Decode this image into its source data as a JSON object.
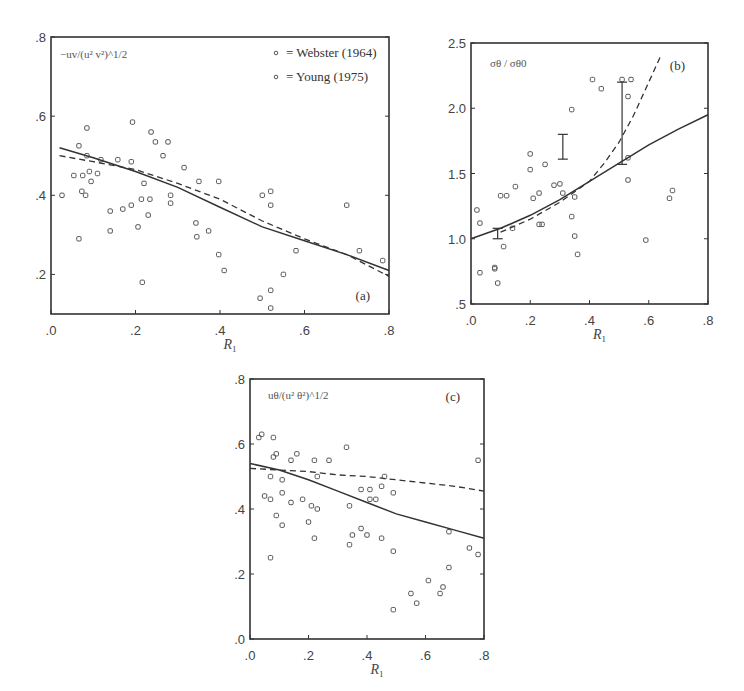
{
  "chart_data": [
    {
      "panel": "a",
      "type": "scatter",
      "tag": "(a)",
      "ylabel": "−uv/(u² v²)^1/2",
      "xlabel": "R1",
      "xlim": [
        0.0,
        0.8
      ],
      "ylim": [
        0.1,
        0.8
      ],
      "xticks": [
        ".0",
        ".2",
        ".4",
        ".6",
        ".8"
      ],
      "yticks": [
        ".2",
        ".4",
        ".6",
        ".8"
      ],
      "grid": false,
      "legend": {
        "position": "upper-right",
        "entries": [
          "= Webster (1964)",
          "= Young (1975)"
        ]
      },
      "series": [
        {
          "name": "data",
          "marker": "o",
          "points": [
            [
              0.026,
              0.4
            ],
            [
              0.066,
              0.29
            ],
            [
              0.054,
              0.45
            ],
            [
              0.066,
              0.525
            ],
            [
              0.085,
              0.57
            ],
            [
              0.073,
              0.41
            ],
            [
              0.082,
              0.4
            ],
            [
              0.075,
              0.45
            ],
            [
              0.091,
              0.46
            ],
            [
              0.095,
              0.435
            ],
            [
              0.11,
              0.455
            ],
            [
              0.085,
              0.5
            ],
            [
              0.118,
              0.49
            ],
            [
              0.14,
              0.36
            ],
            [
              0.14,
              0.31
            ],
            [
              0.158,
              0.49
            ],
            [
              0.17,
              0.365
            ],
            [
              0.19,
              0.375
            ],
            [
              0.19,
              0.485
            ],
            [
              0.193,
              0.585
            ],
            [
              0.206,
              0.32
            ],
            [
              0.214,
              0.39
            ],
            [
              0.216,
              0.18
            ],
            [
              0.22,
              0.43
            ],
            [
              0.23,
              0.35
            ],
            [
              0.234,
              0.39
            ],
            [
              0.237,
              0.56
            ],
            [
              0.247,
              0.535
            ],
            [
              0.265,
              0.5
            ],
            [
              0.277,
              0.535
            ],
            [
              0.283,
              0.4
            ],
            [
              0.283,
              0.38
            ],
            [
              0.315,
              0.47
            ],
            [
              0.343,
              0.33
            ],
            [
              0.345,
              0.295
            ],
            [
              0.35,
              0.435
            ],
            [
              0.373,
              0.31
            ],
            [
              0.397,
              0.435
            ],
            [
              0.397,
              0.25
            ],
            [
              0.41,
              0.21
            ],
            [
              0.5,
              0.4
            ],
            [
              0.52,
              0.41
            ],
            [
              0.52,
              0.375
            ],
            [
              0.495,
              0.14
            ],
            [
              0.52,
              0.16
            ],
            [
              0.52,
              0.115
            ],
            [
              0.55,
              0.2
            ],
            [
              0.58,
              0.26
            ],
            [
              0.7,
              0.375
            ],
            [
              0.73,
              0.26
            ],
            [
              0.785,
              0.235
            ]
          ]
        },
        {
          "name": "solid curve",
          "type": "line",
          "style": "solid",
          "points": [
            [
              0.02,
              0.52
            ],
            [
              0.1,
              0.495
            ],
            [
              0.2,
              0.46
            ],
            [
              0.3,
              0.42
            ],
            [
              0.4,
              0.37
            ],
            [
              0.5,
              0.32
            ],
            [
              0.6,
              0.285
            ],
            [
              0.7,
              0.25
            ],
            [
              0.8,
              0.21
            ]
          ]
        },
        {
          "name": "dashed curve",
          "type": "line",
          "style": "dashed",
          "points": [
            [
              0.02,
              0.5
            ],
            [
              0.1,
              0.485
            ],
            [
              0.2,
              0.465
            ],
            [
              0.3,
              0.43
            ],
            [
              0.4,
              0.39
            ],
            [
              0.5,
              0.335
            ],
            [
              0.6,
              0.29
            ],
            [
              0.7,
              0.25
            ],
            [
              0.8,
              0.195
            ]
          ]
        }
      ]
    },
    {
      "panel": "b",
      "type": "scatter",
      "tag": "(b)",
      "ylabel": "σθ / σθ0",
      "xlabel": "R1",
      "xlim": [
        0.0,
        0.8
      ],
      "ylim": [
        0.5,
        2.5
      ],
      "xticks": [
        ".0",
        ".2",
        ".4",
        ".6",
        ".8"
      ],
      "yticks": [
        ".5",
        "1.0",
        "1.5",
        "2.0",
        "2.5"
      ],
      "grid": false,
      "series": [
        {
          "name": "data",
          "marker": "o",
          "points": [
            [
              0.02,
              1.22
            ],
            [
              0.03,
              1.12
            ],
            [
              0.03,
              0.74
            ],
            [
              0.08,
              0.78
            ],
            [
              0.08,
              0.77
            ],
            [
              0.09,
              0.66
            ],
            [
              0.11,
              0.94
            ],
            [
              0.1,
              1.33
            ],
            [
              0.12,
              1.33
            ],
            [
              0.15,
              1.4
            ],
            [
              0.14,
              1.08
            ],
            [
              0.2,
              1.53
            ],
            [
              0.2,
              1.65
            ],
            [
              0.21,
              1.31
            ],
            [
              0.23,
              1.35
            ],
            [
              0.23,
              1.11
            ],
            [
              0.24,
              1.11
            ],
            [
              0.25,
              1.57
            ],
            [
              0.28,
              1.41
            ],
            [
              0.3,
              1.42
            ],
            [
              0.31,
              1.35
            ],
            [
              0.34,
              1.17
            ],
            [
              0.35,
              1.32
            ],
            [
              0.35,
              1.02
            ],
            [
              0.36,
              0.88
            ],
            [
              0.34,
              1.99
            ],
            [
              0.41,
              2.22
            ],
            [
              0.44,
              2.15
            ],
            [
              0.51,
              2.22
            ],
            [
              0.54,
              2.22
            ],
            [
              0.53,
              2.09
            ],
            [
              0.53,
              1.62
            ],
            [
              0.53,
              1.45
            ],
            [
              0.59,
              0.99
            ],
            [
              0.67,
              1.31
            ],
            [
              0.68,
              1.37
            ]
          ]
        },
        {
          "name": "solid curve",
          "type": "line",
          "style": "solid",
          "points": [
            [
              0.0,
              1.0
            ],
            [
              0.1,
              1.08
            ],
            [
              0.2,
              1.18
            ],
            [
              0.3,
              1.3
            ],
            [
              0.4,
              1.44
            ],
            [
              0.5,
              1.58
            ],
            [
              0.6,
              1.72
            ],
            [
              0.7,
              1.84
            ],
            [
              0.8,
              1.95
            ]
          ]
        },
        {
          "name": "dashed curve",
          "type": "line",
          "style": "dashed",
          "points": [
            [
              0.1,
              1.05
            ],
            [
              0.2,
              1.15
            ],
            [
              0.3,
              1.28
            ],
            [
              0.4,
              1.44
            ],
            [
              0.45,
              1.58
            ],
            [
              0.5,
              1.74
            ],
            [
              0.55,
              1.95
            ],
            [
              0.6,
              2.2
            ],
            [
              0.64,
              2.4
            ]
          ]
        },
        {
          "name": "error bars",
          "type": "errorbar",
          "bars": [
            {
              "x": 0.31,
              "low": 1.61,
              "high": 1.8
            },
            {
              "x": 0.51,
              "low": 1.57,
              "high": 2.2
            },
            {
              "x": 0.09,
              "low": 1.0,
              "high": 1.08
            }
          ]
        }
      ]
    },
    {
      "panel": "c",
      "type": "scatter",
      "tag": "(c)",
      "ylabel": "uθ/(u² θ²)^1/2",
      "xlabel": "R1",
      "xlim": [
        0.0,
        0.8
      ],
      "ylim": [
        0.0,
        0.8
      ],
      "xticks": [
        ".0",
        ".2",
        ".4",
        ".6",
        ".8"
      ],
      "yticks": [
        ".0",
        ".2",
        ".4",
        ".6",
        ".8"
      ],
      "grid": false,
      "series": [
        {
          "name": "data",
          "marker": "o",
          "points": [
            [
              0.03,
              0.62
            ],
            [
              0.04,
              0.63
            ],
            [
              0.08,
              0.62
            ],
            [
              0.08,
              0.56
            ],
            [
              0.09,
              0.57
            ],
            [
              0.14,
              0.55
            ],
            [
              0.07,
              0.5
            ],
            [
              0.11,
              0.49
            ],
            [
              0.05,
              0.44
            ],
            [
              0.07,
              0.43
            ],
            [
              0.11,
              0.45
            ],
            [
              0.14,
              0.42
            ],
            [
              0.18,
              0.43
            ],
            [
              0.21,
              0.41
            ],
            [
              0.23,
              0.4
            ],
            [
              0.09,
              0.38
            ],
            [
              0.11,
              0.35
            ],
            [
              0.2,
              0.36
            ],
            [
              0.22,
              0.31
            ],
            [
              0.07,
              0.25
            ],
            [
              0.16,
              0.57
            ],
            [
              0.22,
              0.55
            ],
            [
              0.27,
              0.55
            ],
            [
              0.33,
              0.59
            ],
            [
              0.23,
              0.5
            ],
            [
              0.34,
              0.41
            ],
            [
              0.34,
              0.29
            ],
            [
              0.35,
              0.32
            ],
            [
              0.38,
              0.34
            ],
            [
              0.4,
              0.32
            ],
            [
              0.38,
              0.46
            ],
            [
              0.41,
              0.46
            ],
            [
              0.45,
              0.47
            ],
            [
              0.49,
              0.45
            ],
            [
              0.41,
              0.43
            ],
            [
              0.43,
              0.43
            ],
            [
              0.45,
              0.31
            ],
            [
              0.49,
              0.27
            ],
            [
              0.49,
              0.09
            ],
            [
              0.55,
              0.14
            ],
            [
              0.57,
              0.11
            ],
            [
              0.61,
              0.18
            ],
            [
              0.65,
              0.14
            ],
            [
              0.66,
              0.16
            ],
            [
              0.68,
              0.22
            ],
            [
              0.68,
              0.33
            ],
            [
              0.75,
              0.28
            ],
            [
              0.78,
              0.26
            ],
            [
              0.78,
              0.55
            ],
            [
              0.46,
              0.5
            ]
          ]
        },
        {
          "name": "solid curve",
          "type": "line",
          "style": "solid",
          "points": [
            [
              0.0,
              0.54
            ],
            [
              0.1,
              0.52
            ],
            [
              0.2,
              0.49
            ],
            [
              0.3,
              0.455
            ],
            [
              0.4,
              0.42
            ],
            [
              0.5,
              0.385
            ],
            [
              0.6,
              0.36
            ],
            [
              0.7,
              0.335
            ],
            [
              0.8,
              0.31
            ]
          ]
        },
        {
          "name": "dashed curve",
          "type": "line",
          "style": "dashed",
          "points": [
            [
              0.0,
              0.525
            ],
            [
              0.1,
              0.52
            ],
            [
              0.2,
              0.515
            ],
            [
              0.3,
              0.505
            ],
            [
              0.4,
              0.5
            ],
            [
              0.5,
              0.49
            ],
            [
              0.6,
              0.48
            ],
            [
              0.7,
              0.47
            ],
            [
              0.8,
              0.455
            ]
          ]
        }
      ]
    }
  ]
}
